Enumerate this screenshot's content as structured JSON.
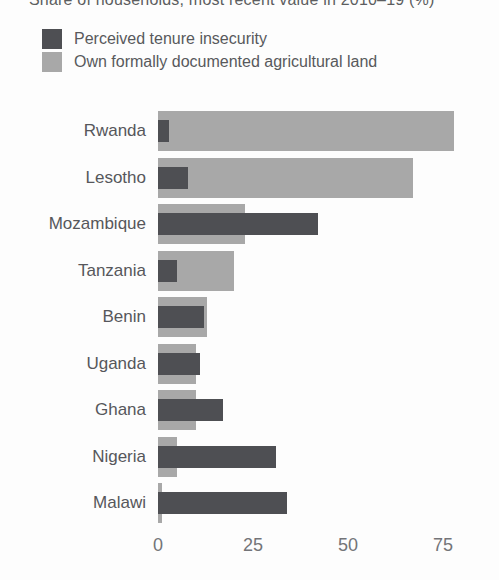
{
  "title": "Share of households, most recent value in 2010–19 (%)",
  "legend": {
    "items": [
      {
        "label": "Perceived tenure insecurity",
        "series": "insecurity"
      },
      {
        "label": "Own formally documented agricultural land",
        "series": "documented"
      }
    ]
  },
  "axis": {
    "ticks": [
      0,
      25,
      50,
      75
    ],
    "max": 82
  },
  "rows": [
    {
      "country": "Rwanda",
      "insecurity": 3,
      "documented": 78
    },
    {
      "country": "Lesotho",
      "insecurity": 8,
      "documented": 67
    },
    {
      "country": "Mozambique",
      "insecurity": 42,
      "documented": 23
    },
    {
      "country": "Tanzania",
      "insecurity": 5,
      "documented": 20
    },
    {
      "country": "Benin",
      "insecurity": 12,
      "documented": 13
    },
    {
      "country": "Uganda",
      "insecurity": 11,
      "documented": 10
    },
    {
      "country": "Ghana",
      "insecurity": 17,
      "documented": 10
    },
    {
      "country": "Nigeria",
      "insecurity": 31,
      "documented": 5
    },
    {
      "country": "Malawi",
      "insecurity": 34,
      "documented": 1
    }
  ],
  "colors": {
    "insecurity": "#4e4f53",
    "documented": "#a8a8a8",
    "label_text": "#56575b",
    "tick_text": "#737478",
    "background": "#fdfdfd"
  },
  "chart_data": {
    "type": "bar",
    "orientation": "horizontal",
    "title": "Share of households, most recent value in 2010–19 (%)",
    "categories": [
      "Rwanda",
      "Lesotho",
      "Mozambique",
      "Tanzania",
      "Benin",
      "Uganda",
      "Ghana",
      "Nigeria",
      "Malawi"
    ],
    "series": [
      {
        "name": "Perceived tenure insecurity",
        "color": "#4e4f53",
        "values": [
          3,
          8,
          42,
          5,
          12,
          11,
          17,
          31,
          34
        ]
      },
      {
        "name": "Own formally documented agricultural land",
        "color": "#a8a8a8",
        "values": [
          78,
          67,
          23,
          20,
          13,
          10,
          10,
          5,
          1
        ]
      }
    ],
    "xlabel": "",
    "ylabel": "",
    "xlim": [
      0,
      82
    ],
    "xticks": [
      0,
      25,
      50,
      75
    ],
    "grid": false,
    "legend_position": "top-left",
    "bar_style": "overlapped (documented series drawn wider/behind, insecurity series narrower/in front)"
  }
}
